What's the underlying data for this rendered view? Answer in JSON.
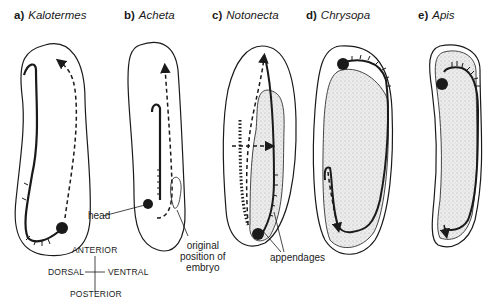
{
  "figure": {
    "panels": [
      {
        "letter": "a)",
        "species": "Kalotermes"
      },
      {
        "letter": "b)",
        "species": "Acheta"
      },
      {
        "letter": "c)",
        "species": "Notonecta"
      },
      {
        "letter": "d)",
        "species": "Chrysopa"
      },
      {
        "letter": "e)",
        "species": "Apis"
      }
    ],
    "annotations": {
      "head": "head",
      "original_position_line1": "original",
      "original_position_line2": "position of",
      "original_position_line3": "embryo",
      "appendages": "appendages"
    },
    "orientation_key": {
      "anterior": "ANTERIOR",
      "posterior": "POSTERIOR",
      "dorsal": "DORSAL",
      "ventral": "VENTRAL"
    },
    "colors": {
      "line": "#1a1a1a",
      "yolk_stipple": "#e4e4e4",
      "background": "#ffffff"
    }
  }
}
